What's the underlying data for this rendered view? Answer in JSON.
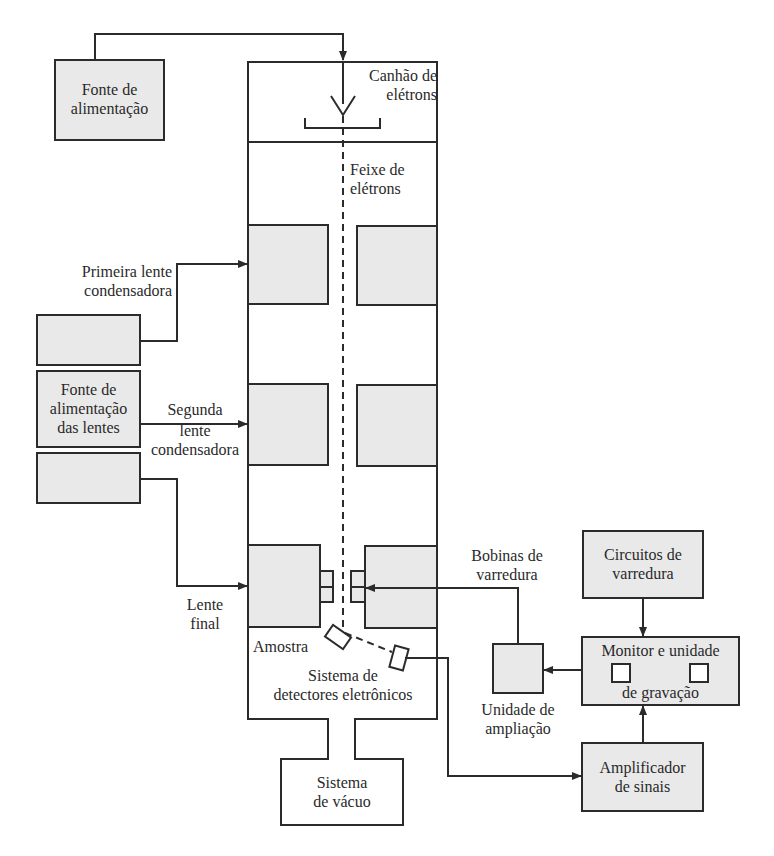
{
  "colors": {
    "line": "#2b2b2b",
    "box_fill": "#e9e9e9",
    "background": "#ffffff",
    "text": "#2a2a2a"
  },
  "components": {
    "power_supply": {
      "line1": "Fonte de",
      "line2": "alimentação"
    },
    "electron_gun": {
      "line1": "Canhão de",
      "line2": "elétrons"
    },
    "electron_beam": {
      "line1": "Feixe de",
      "line2": "elétrons"
    },
    "first_condenser": {
      "line1": "Primeira lente",
      "line2": "condensadora"
    },
    "lens_power_supply": {
      "line1": "Fonte de",
      "line2": "alimentação",
      "line3": "das lentes"
    },
    "second_condenser": {
      "line1": "Segunda",
      "line2": "lente",
      "line3": "condensadora"
    },
    "final_lens": {
      "line1": "Lente",
      "line2": "final"
    },
    "sample": {
      "label": "Amostra"
    },
    "detector_system": {
      "line1": "Sistema de",
      "line2": "detectores eletrônicos"
    },
    "vacuum_system": {
      "line1": "Sistema",
      "line2": "de vácuo"
    },
    "scan_coils": {
      "line1": "Bobinas de",
      "line2": "varredura"
    },
    "scan_circuits": {
      "line1": "Circuitos de",
      "line2": "varredura"
    },
    "magnification_unit": {
      "line1": "Unidade de",
      "line2": "ampliação"
    },
    "monitor_recording": {
      "line1": "Monitor e unidade",
      "line2": "de gravação"
    },
    "signal_amplifier": {
      "line1": "Amplificador",
      "line2": "de sinais"
    }
  }
}
